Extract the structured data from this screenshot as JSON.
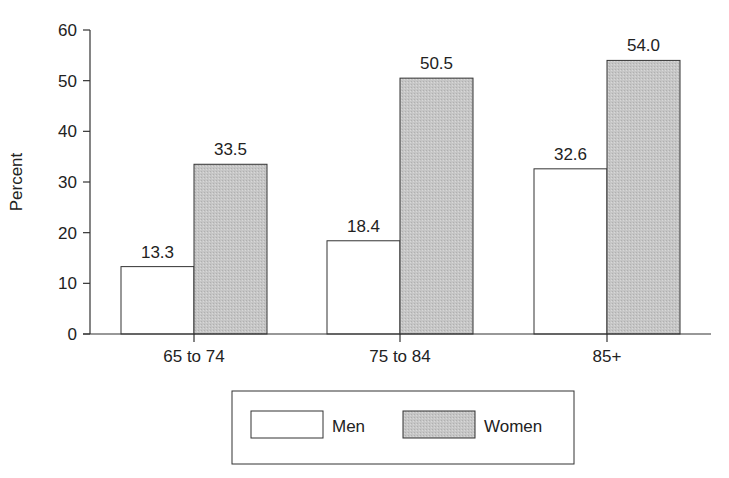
{
  "chart_data": {
    "type": "bar",
    "title": "",
    "xlabel": "",
    "ylabel": "Percent",
    "ylim": [
      0,
      60
    ],
    "yticks": [
      0,
      10,
      20,
      30,
      40,
      50,
      60
    ],
    "grid": false,
    "categories": [
      "65 to 74",
      "75 to 84",
      "85+"
    ],
    "series": [
      {
        "name": "Men",
        "values": [
          13.3,
          18.4,
          32.6
        ],
        "labels": [
          "13.3",
          "18.4",
          "32.6"
        ],
        "color": "#ffffff"
      },
      {
        "name": "Women",
        "values": [
          33.5,
          50.5,
          54.0
        ],
        "labels": [
          "33.5",
          "50.5",
          "54.0"
        ],
        "color": "#c8c8c8"
      }
    ],
    "legend": {
      "position": "bottom",
      "entries": [
        "Men",
        "Women"
      ]
    }
  }
}
